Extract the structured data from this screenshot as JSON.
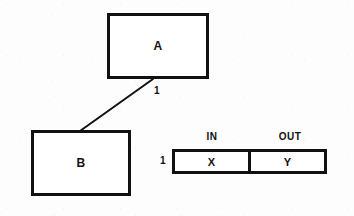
{
  "diagram": {
    "type": "entity-relationship-fragment",
    "background_color": "#fdfdfd",
    "line_color": "#111111",
    "nodes": [
      {
        "id": "a",
        "label": "A",
        "x": 107,
        "y": 13,
        "width": 102,
        "height": 66
      },
      {
        "id": "b",
        "label": "B",
        "x": 31,
        "y": 130,
        "width": 100,
        "height": 66
      }
    ],
    "edges": [
      {
        "id": "a-b",
        "from": "a",
        "to": "b",
        "cardinality_label": "1",
        "x1": 153,
        "y1": 79,
        "x2": 80,
        "y2": 131
      }
    ],
    "record_table": {
      "row_label": "1",
      "headers": [
        {
          "key": "in",
          "label": "IN"
        },
        {
          "key": "out",
          "label": "OUT"
        }
      ],
      "cells": [
        {
          "key": "in",
          "value": "X"
        },
        {
          "key": "out",
          "value": "Y"
        }
      ]
    }
  }
}
